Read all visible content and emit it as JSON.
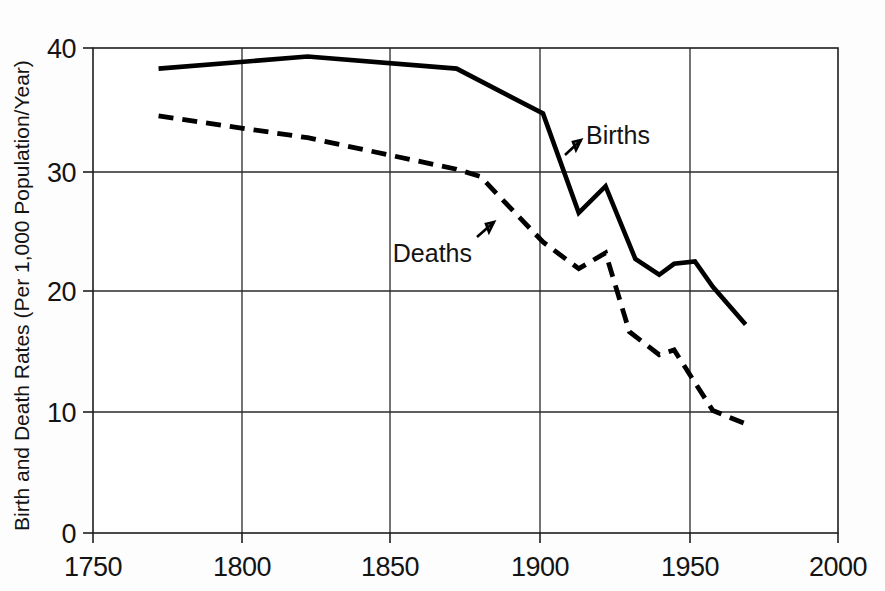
{
  "chart_data": {
    "type": "line",
    "title": "",
    "xlabel": "",
    "ylabel": "Birth and Death Rates (Per 1,000 Population/Year)",
    "xlim": [
      1750,
      2000
    ],
    "ylim": [
      0,
      40
    ],
    "xticks": [
      "1750",
      "1800",
      "1850",
      "1900",
      "1950",
      "2000"
    ],
    "xtick_values": [
      1750,
      1800,
      1850,
      1900,
      1950,
      2000
    ],
    "yticks": [
      "0",
      "10",
      "20",
      "30",
      "40"
    ],
    "ytick_values": [
      0,
      10,
      20,
      30,
      40
    ],
    "grid": true,
    "legend_position": "inline-annotations",
    "series": [
      {
        "name": "Births",
        "style": "solid",
        "color": "#000000",
        "x": [
          1772,
          1822,
          1872,
          1901,
          1913,
          1922,
          1932,
          1940,
          1945,
          1952,
          1958,
          1969
        ],
        "values": [
          38.3,
          39.3,
          38.3,
          34.6,
          26.4,
          28.6,
          22.6,
          21.3,
          22.2,
          22.4,
          20.3,
          17.2
        ]
      },
      {
        "name": "Deaths",
        "style": "dashed",
        "color": "#000000",
        "x": [
          1772,
          1822,
          1872,
          1880,
          1901,
          1913,
          1922,
          1930,
          1940,
          1945,
          1952,
          1958,
          1969
        ],
        "values": [
          34.4,
          32.6,
          30.0,
          29.4,
          24.0,
          21.8,
          23.1,
          16.6,
          14.7,
          15.1,
          12.4,
          10.1,
          9.0
        ]
      }
    ],
    "annotations": [
      {
        "text": "Births",
        "x": 1903,
        "y": 33.0
      },
      {
        "text": "Deaths",
        "x": 1854,
        "y": 24.5
      }
    ]
  }
}
